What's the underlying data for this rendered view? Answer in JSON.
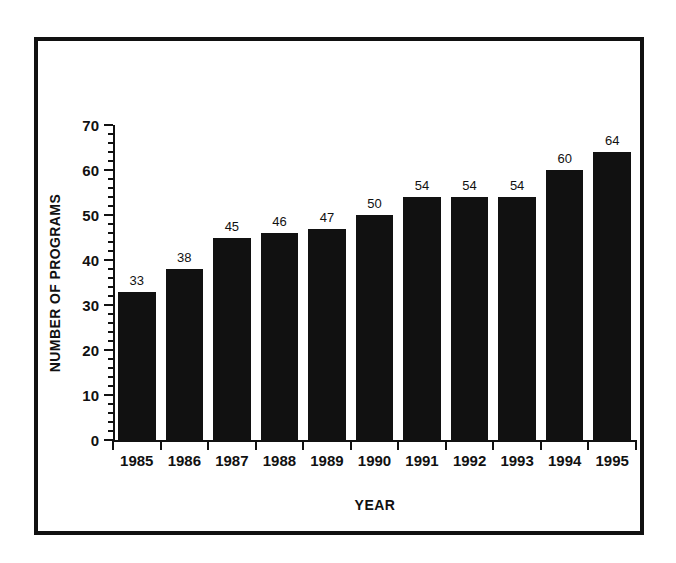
{
  "chart_data": {
    "type": "bar",
    "title": "",
    "xlabel": "YEAR",
    "ylabel": "NUMBER OF PROGRAMS",
    "categories": [
      "1985",
      "1986",
      "1987",
      "1988",
      "1989",
      "1990",
      "1991",
      "1992",
      "1993",
      "1994",
      "1995"
    ],
    "values": [
      33,
      38,
      45,
      46,
      47,
      50,
      54,
      54,
      54,
      60,
      64
    ],
    "value_labels": [
      "33",
      "38",
      "45",
      "46",
      "47",
      "50",
      "54",
      "54",
      "54",
      "60",
      "64"
    ],
    "ylim": [
      0,
      70
    ],
    "ytick_labels": [
      "0",
      "10",
      "20",
      "30",
      "40",
      "50",
      "60",
      "70"
    ],
    "ytick_values": [
      0,
      10,
      20,
      30,
      40,
      50,
      60,
      70
    ],
    "yminor_step": 2,
    "grid": false,
    "legend": null,
    "bar_color": "#111111",
    "axis_color": "#111111",
    "background": "#ffffff",
    "frame_color": "#111111"
  }
}
